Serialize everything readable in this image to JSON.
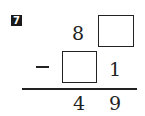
{
  "problem": {
    "number": "7",
    "operation": "subtraction",
    "minuend": {
      "tens": "8",
      "ones": ""
    },
    "subtrahend": {
      "tens": "",
      "ones": "1"
    },
    "difference": {
      "tens": "4",
      "ones": "9"
    },
    "operator_symbol": "minus-sign"
  }
}
